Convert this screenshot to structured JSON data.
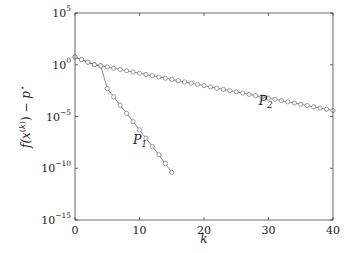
{
  "chart_data": {
    "type": "line",
    "title": "",
    "xlabel": "k",
    "ylabel": "f(x^(k)) − p*",
    "yscale": "log",
    "xlim": [
      0,
      40
    ],
    "ylim_exponent": [
      -15,
      5
    ],
    "grid": false,
    "legend": "none (inline labels)",
    "x_ticks": [
      "0",
      "10",
      "20",
      "30",
      "40"
    ],
    "y_ticks": [
      {
        "base": "10",
        "exp": "5"
      },
      {
        "base": "10",
        "exp": "0"
      },
      {
        "base": "10",
        "exp": "−5"
      },
      {
        "base": "10",
        "exp": "−10"
      },
      {
        "base": "10",
        "exp": "−15"
      }
    ],
    "series": [
      {
        "name": "P1",
        "label_main": "P",
        "label_sub": "1",
        "marker": "circle",
        "x": [
          0,
          1,
          2,
          3,
          4,
          5,
          6,
          7,
          8,
          9,
          10,
          11,
          12,
          13,
          14,
          15
        ],
        "log10_y": [
          0.75,
          0.5,
          0.25,
          0.0,
          -0.1,
          -2.3,
          -3.1,
          -3.9,
          -4.7,
          -5.5,
          -6.3,
          -7.1,
          -7.9,
          -8.7,
          -9.55,
          -10.4
        ]
      },
      {
        "name": "P2",
        "label_main": "P",
        "label_sub": "2",
        "marker": "circle",
        "x": [
          0,
          1,
          2,
          3,
          4,
          5,
          6,
          7,
          8,
          9,
          10,
          11,
          12,
          13,
          14,
          15,
          16,
          17,
          18,
          19,
          20,
          21,
          22,
          23,
          24,
          25,
          26,
          27,
          28,
          29,
          30,
          31,
          32,
          33,
          34,
          35,
          36,
          37,
          38,
          39,
          40
        ],
        "log10_y": [
          0.75,
          0.5,
          0.25,
          0.0,
          -0.1,
          -0.22,
          -0.34,
          -0.46,
          -0.58,
          -0.7,
          -0.82,
          -0.94,
          -1.06,
          -1.18,
          -1.3,
          -1.42,
          -1.54,
          -1.66,
          -1.78,
          -1.9,
          -2.02,
          -2.14,
          -2.26,
          -2.38,
          -2.5,
          -2.62,
          -2.74,
          -2.86,
          -2.98,
          -3.1,
          -3.22,
          -3.34,
          -3.46,
          -3.58,
          -3.7,
          -3.82,
          -3.94,
          -4.06,
          -4.18,
          -4.3,
          -4.42
        ]
      }
    ],
    "annotations": [
      {
        "text": "P1",
        "x": 9.0,
        "log10_y": -7.7
      },
      {
        "text": "P2",
        "x": 28.5,
        "log10_y": -3.9
      }
    ]
  }
}
